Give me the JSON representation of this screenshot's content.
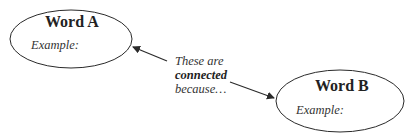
{
  "nodes": [
    {
      "id": "a",
      "title": "Word A",
      "example_label": "Example:"
    },
    {
      "id": "b",
      "title": "Word B",
      "example_label": "Example:"
    }
  ],
  "connector": {
    "line1": "These are",
    "line2": "connected",
    "line3": "because…"
  },
  "colors": {
    "stroke": "#2a2a2a",
    "background": "#ffffff"
  }
}
